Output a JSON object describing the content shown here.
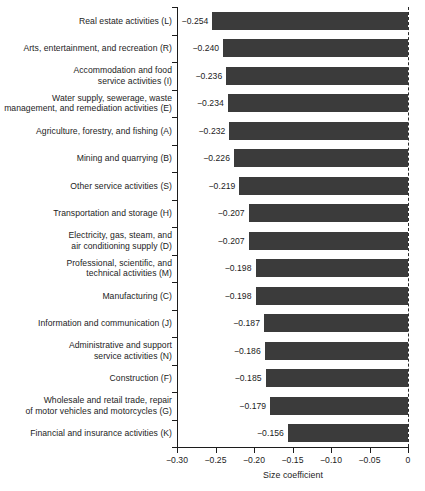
{
  "chart_data": {
    "type": "bar",
    "orientation": "horizontal",
    "title": "",
    "xlabel": "Size coefficient",
    "ylabel": "",
    "xlim": [
      -0.3,
      0
    ],
    "xticks": [
      -0.3,
      -0.25,
      -0.2,
      -0.15,
      -0.1,
      -0.05,
      0
    ],
    "xtick_labels": [
      "−0.30",
      "−0.25",
      "−0.20",
      "−0.15",
      "−0.10",
      "−0.05",
      "0"
    ],
    "grid": false,
    "legend": null,
    "bar_color": "#3b3b3b",
    "zero_reference_line": "dashed",
    "categories": [
      "Real estate activities (L)",
      "Arts, entertainment, and recreation (R)",
      "Accommodation and food service activities (I)",
      "Water supply, sewerage, waste management, and remediation activities (E)",
      "Agriculture, forestry, and fishing (A)",
      "Mining and quarrying (B)",
      "Other service activities (S)",
      "Transportation and storage (H)",
      "Electricity, gas, steam, and air conditioning supply (D)",
      "Professional, scientific, and technical activities (M)",
      "Manufacturing (C)",
      "Information and communication (J)",
      "Administrative and support service activities (N)",
      "Construction (F)",
      "Wholesale and retail trade, repair of motor vehicles and motorcycles (G)",
      "Financial and insurance activities (K)"
    ],
    "values": [
      -0.254,
      -0.24,
      -0.236,
      -0.234,
      -0.232,
      -0.226,
      -0.219,
      -0.207,
      -0.207,
      -0.198,
      -0.198,
      -0.187,
      -0.186,
      -0.185,
      -0.179,
      -0.156
    ],
    "data_labels": [
      "−0.254",
      "−0.240",
      "−0.236",
      "−0.234",
      "−0.232",
      "−0.226",
      "−0.219",
      "−0.207",
      "−0.207",
      "−0.198",
      "−0.198",
      "−0.187",
      "−0.186",
      "−0.185",
      "−0.179",
      "−0.156"
    ],
    "category_lines": [
      [
        "Real estate activities (L)"
      ],
      [
        "Arts, entertainment, and recreation (R)"
      ],
      [
        "Accommodation and food",
        "service activities (I)"
      ],
      [
        "Water supply, sewerage, waste",
        "management, and remediation activities (E)"
      ],
      [
        "Agriculture, forestry, and fishing (A)"
      ],
      [
        "Mining and quarrying (B)"
      ],
      [
        "Other service activities (S)"
      ],
      [
        "Transportation and storage (H)"
      ],
      [
        "Electricity, gas, steam, and",
        "air conditioning supply (D)"
      ],
      [
        "Professional, scientific, and",
        "technical activities (M)"
      ],
      [
        "Manufacturing (C)"
      ],
      [
        "Information and communication (J)"
      ],
      [
        "Administrative and support",
        "service activities (N)"
      ],
      [
        "Construction (F)"
      ],
      [
        "Wholesale and retail trade, repair",
        "of motor vehicles and motorcycles (G)"
      ],
      [
        "Financial and insurance activities (K)"
      ]
    ]
  }
}
